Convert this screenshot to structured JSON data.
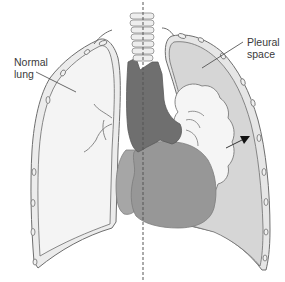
{
  "figure": {
    "type": "anatomical-diagram",
    "labels": {
      "normal_lung": {
        "line1": "Normal",
        "line2": "lung"
      },
      "pleural_space": {
        "line1": "Pleural",
        "line2": "space"
      }
    },
    "structures": [
      "normal-lung",
      "pleural-space",
      "collapsed-lung",
      "heart",
      "trachea",
      "mediastinum",
      "ribs",
      "midline"
    ],
    "colors": {
      "background": "#ffffff",
      "outline": "#6e6e6e",
      "normal_lung_fill": "#f2f2f2",
      "pleural_space_fill": "#d9d9d9",
      "collapsed_lung_fill": "#f4f4f4",
      "heart_fill": "#9a9a9a",
      "heart_right_fill": "#8c8c8c",
      "mediastinum_fill": "#6f6f6f",
      "trachea_fill": "#eeeeee",
      "label_text": "#3a3a3a",
      "arrow": "#111111",
      "midline": "#666666"
    }
  }
}
